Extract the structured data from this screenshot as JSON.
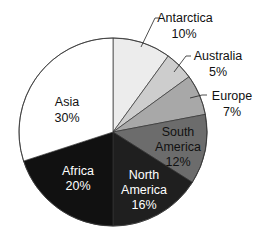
{
  "chart_data": {
    "type": "pie",
    "title": "",
    "start_angle_deg": 0,
    "direction": "clockwise",
    "categories": [
      "Antarctica",
      "Australia",
      "Europe",
      "South America",
      "North America",
      "Africa",
      "Asia"
    ],
    "values": [
      10,
      5,
      7,
      12,
      16,
      20,
      30
    ],
    "unit": "%",
    "colors": [
      "#ececec",
      "#cdcdcd",
      "#a8a8a8",
      "#6c6c6c",
      "#1f1f1f",
      "#111111",
      "#ffffff"
    ],
    "labels": [
      {
        "name": "Antarctica",
        "pct": "10%"
      },
      {
        "name": "Australia",
        "pct": "5%"
      },
      {
        "name": "Europe",
        "pct": "7%"
      },
      {
        "name": "South",
        "name2": "America",
        "pct": "12%"
      },
      {
        "name": "North",
        "name2": "America",
        "pct": "16%"
      },
      {
        "name": "Africa",
        "pct": "20%"
      },
      {
        "name": "Asia",
        "pct": "30%"
      }
    ]
  }
}
